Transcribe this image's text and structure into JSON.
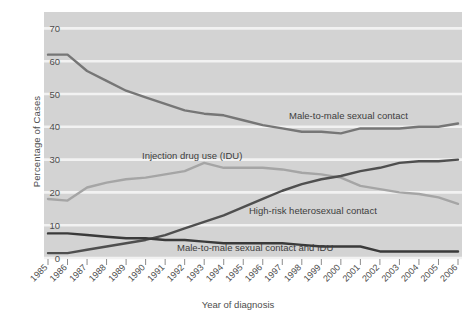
{
  "chart_data": {
    "type": "line",
    "title": "",
    "xlabel": "Year of diagnosis",
    "ylabel": "Percentage of Cases",
    "ylim": [
      0,
      75
    ],
    "yticks": [
      0,
      10,
      20,
      30,
      40,
      50,
      60,
      70
    ],
    "grid": true,
    "legend_position": "inline-annotations",
    "categories": [
      "1985",
      "1986",
      "1987",
      "1988",
      "1989",
      "1990",
      "1991",
      "1992",
      "1993",
      "1994",
      "1995",
      "1996",
      "1997",
      "1998",
      "1999",
      "2000",
      "2001",
      "2002",
      "2003",
      "2004",
      "2005",
      "2006"
    ],
    "series": [
      {
        "name": "Male-to-male sexual contact",
        "color": "#767676",
        "values": [
          62.0,
          62.0,
          57.0,
          54.0,
          51.0,
          49.0,
          47.0,
          45.0,
          44.0,
          43.5,
          42.0,
          40.5,
          39.5,
          38.5,
          38.5,
          38.0,
          39.5,
          39.5,
          39.5,
          40.0,
          40.0,
          41.0
        ]
      },
      {
        "name": "Injection drug use (IDU)",
        "color": "#a5a5a5",
        "values": [
          18.0,
          17.5,
          21.5,
          23.0,
          24.0,
          24.5,
          25.5,
          26.5,
          29.0,
          27.5,
          27.5,
          27.5,
          27.0,
          26.0,
          25.5,
          24.5,
          22.0,
          21.0,
          20.0,
          19.5,
          18.5,
          16.5
        ]
      },
      {
        "name": "High-risk heterosexual contact",
        "color": "#4f4f4f",
        "values": [
          1.5,
          1.5,
          2.5,
          3.5,
          4.5,
          5.5,
          7.0,
          9.0,
          11.0,
          13.0,
          15.5,
          18.0,
          20.5,
          22.5,
          24.0,
          25.0,
          26.5,
          27.5,
          29.0,
          29.5,
          29.5,
          30.0
        ]
      },
      {
        "name": "Male-to-male sexual contact and IDU",
        "color": "#3a3a3a",
        "values": [
          7.5,
          7.5,
          7.0,
          6.5,
          6.0,
          6.0,
          5.5,
          5.5,
          5.0,
          4.5,
          4.5,
          4.5,
          4.5,
          4.0,
          3.5,
          3.5,
          3.5,
          2.0,
          2.0,
          2.0,
          2.0,
          2.0
        ]
      }
    ],
    "annotations": [
      {
        "text": "Male-to-male sexual contact",
        "x": 289,
        "y": 119
      },
      {
        "text": "Injection drug use (IDU)",
        "x": 142,
        "y": 159
      },
      {
        "text": "High-risk heterosexual contact",
        "x": 249,
        "y": 214
      },
      {
        "text": "Male-to-male sexual contact and IDU",
        "x": 177,
        "y": 251
      }
    ]
  },
  "style": {
    "plot_background": "#d3d3d3",
    "gridline_color": "#f2f2f2",
    "page_background": "#ffffff",
    "tick_color": "#8c8c8c"
  }
}
